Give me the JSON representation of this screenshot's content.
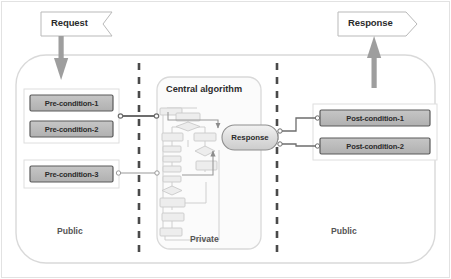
{
  "diagram": {
    "title_absent": true,
    "inputs": {
      "request_banner": "Request",
      "response_banner": "Response"
    },
    "zones": [
      {
        "name": "public-left",
        "label": "Public"
      },
      {
        "name": "private-middle",
        "label": "Private"
      },
      {
        "name": "public-right",
        "label": "Public"
      }
    ],
    "central": {
      "title": "Central algorithm",
      "response_node": "Response"
    },
    "preconditions": [
      {
        "label": "Pre-condition-1"
      },
      {
        "label": "Pre-condition-2"
      },
      {
        "label": "Pre-condition-3"
      }
    ],
    "postconditions": [
      {
        "label": "Post-condition-1"
      },
      {
        "label": "Post-condition-2"
      }
    ],
    "colors": {
      "box_fill": "#b8b8b8",
      "box_border": "#5a5a5a",
      "group_border": "#d6d6d6",
      "outer_border": "#d9d9d9",
      "divider": "#4a4a4a",
      "arrow_gray": "#9a9a9a",
      "connector": "#8c8c8c",
      "text_dark": "#2b2b2b",
      "text_zone": "#555555",
      "canvas": "#ffffff",
      "flow_fill": "#e6e6e6",
      "flow_stroke": "#c9c9c9"
    }
  }
}
